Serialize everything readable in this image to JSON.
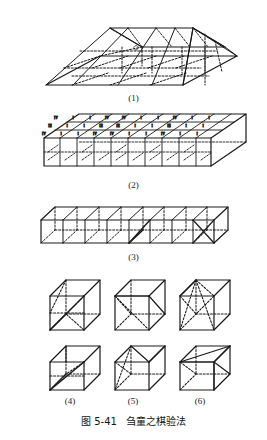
{
  "page": {
    "width": 267,
    "height": 440,
    "background": "#ffffff",
    "ink": "#1a1a1a"
  },
  "caption": {
    "figure_number": "图 5-41",
    "title": "刍童之棋验法",
    "full": "图 5-41    刍童之棋验法"
  },
  "figures": [
    {
      "id": "fig1",
      "label": "(1)",
      "name": "frustum-assembled",
      "description": "assembled frustum (chutong) built from blocks, with hidden edges dashed"
    },
    {
      "id": "fig2",
      "label": "(2)",
      "name": "block-layer-labeled",
      "description": "flat slab of blocks whose slanted top faces carry Roman numeral labels"
    },
    {
      "id": "fig3",
      "label": "(3)",
      "name": "cube-row",
      "description": "row of eight unit cubes in a line"
    },
    {
      "id": "fig4",
      "label": "(4)",
      "name": "cube-pair-4",
      "description": "two dissected unit cubes, column one"
    },
    {
      "id": "fig5",
      "label": "(5)",
      "name": "cube-pair-5",
      "description": "two dissected unit cubes, column two"
    },
    {
      "id": "fig6",
      "label": "(6)",
      "name": "cube-pair-6",
      "description": "two dissected unit cubes, column three"
    }
  ],
  "fig2_labels": {
    "row_top": [
      "IV",
      "I",
      "I",
      "IV",
      "IV",
      "I",
      "I",
      "IV",
      "I",
      "I"
    ],
    "row_middle": [
      "III",
      "I",
      "I",
      "III",
      "III",
      "I",
      "I",
      "III",
      "I",
      "I"
    ],
    "row_bottom": [
      "IV",
      "I",
      "I",
      "IV",
      "IV",
      "I",
      "I",
      "IV",
      "I",
      "I"
    ]
  },
  "fig3": {
    "cube_count": 8
  },
  "fig456": {
    "columns": 3,
    "rows": 2,
    "cube_count": 6
  },
  "style": {
    "line_color": "#1a1a1a",
    "dash_pattern": "2,1.6"
  }
}
